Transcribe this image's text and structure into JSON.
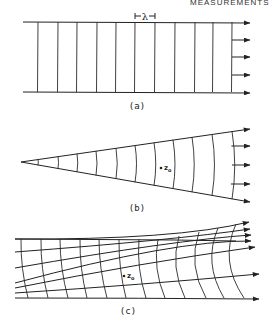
{
  "header": {
    "text": "MEASUREMENTS"
  },
  "panels": [
    {
      "id": "a",
      "label": "(a)",
      "description": "plane wavefronts",
      "wavelength_symbol": "λ",
      "top_y": 22,
      "bottom_y": 92,
      "left_x": 23,
      "right_x": 232,
      "wavefronts_x": [
        38,
        58,
        77,
        97,
        116,
        135,
        155,
        175,
        195,
        213,
        232
      ],
      "arrows_y": [
        22,
        40,
        57,
        75,
        92
      ],
      "arrow_tip_x": 250,
      "label_pos": [
        137,
        109
      ]
    },
    {
      "id": "b",
      "label": "(b)",
      "description": "spherical diverging wavefronts",
      "apex": [
        21,
        162
      ],
      "top_end": [
        250,
        129
      ],
      "bottom_end": [
        250,
        202
      ],
      "wavefronts_x": [
        40,
        60,
        79,
        98,
        118,
        137,
        156,
        175,
        194,
        214,
        234
      ],
      "arrows_y": [
        129,
        146,
        165,
        184,
        202
      ],
      "point_label": "z",
      "point_sub": "o",
      "point": [
        161,
        168
      ],
      "label_pos": [
        137,
        211
      ]
    },
    {
      "id": "c",
      "label": "(c)",
      "description": "ray paths and wavefronts in inhomogeneous medium with focusing",
      "rays": [
        {
          "start": [
            15,
            239
          ],
          "mid": [
            175,
            240
          ],
          "end": [
            249,
            222
          ]
        },
        {
          "start": [
            15,
            252
          ],
          "mid": [
            175,
            240
          ],
          "end": [
            250,
            229
          ]
        },
        {
          "start": [
            15,
            268
          ],
          "mid": [
            175,
            240
          ],
          "end": [
            251,
            235
          ]
        },
        {
          "start": [
            15,
            283
          ],
          "mid": [
            175,
            240
          ],
          "end": [
            251,
            241
          ]
        },
        {
          "start": [
            15,
            288
          ],
          "mid": [
            140,
            263
          ],
          "end": [
            255,
            247
          ]
        },
        {
          "start": [
            15,
            293
          ],
          "mid": [
            140,
            285
          ],
          "end": [
            259,
            274
          ]
        },
        {
          "start": [
            15,
            298
          ],
          "mid": [
            140,
            298
          ],
          "end": [
            259,
            299
          ]
        }
      ],
      "wavefronts_top_x": [
        21,
        41,
        60,
        80,
        99,
        119,
        139,
        158,
        179,
        199,
        218,
        236
      ],
      "wavefronts_bottom_x": [
        28,
        48,
        68,
        87,
        107,
        126,
        146,
        165,
        185,
        206,
        224,
        244
      ],
      "point_label": "z",
      "point_sub": "o",
      "point": [
        124,
        276
      ],
      "label_pos": [
        128,
        314
      ]
    }
  ],
  "colors": {
    "ink": "#222222",
    "background": "#ffffff"
  }
}
